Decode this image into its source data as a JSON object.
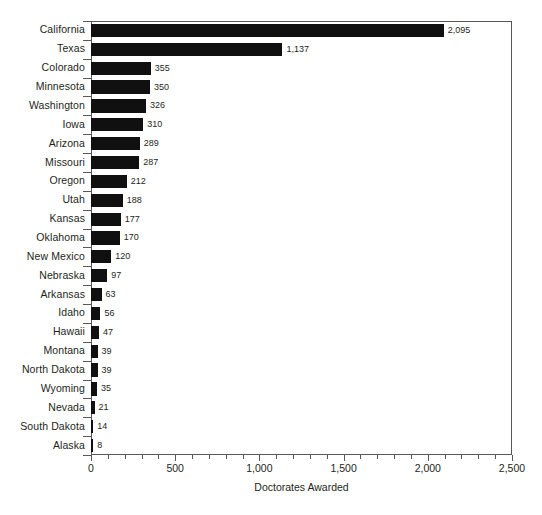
{
  "chart_data": {
    "type": "bar",
    "orientation": "horizontal",
    "title": "",
    "xlabel": "Doctorates Awarded",
    "ylabel": "",
    "xlim": [
      0,
      2500
    ],
    "xticks": [
      0,
      500,
      1000,
      1500,
      2000,
      2500
    ],
    "xtick_labels": [
      "0",
      "500",
      "1,000",
      "1,500",
      "2,000",
      "2,500"
    ],
    "minor_tick_interval": 100,
    "grid": false,
    "legend": null,
    "bar_color": "#101010",
    "axis_color": "#58585b",
    "text_color": "#231f20",
    "background": "#ffffff",
    "categories": [
      "California",
      "Texas",
      "Colorado",
      "Minnesota",
      "Washington",
      "Iowa",
      "Arizona",
      "Missouri",
      "Oregon",
      "Utah",
      "Kansas",
      "Oklahoma",
      "New Mexico",
      "Nebraska",
      "Arkansas",
      "Idaho",
      "Hawaii",
      "Montana",
      "North Dakota",
      "Wyoming",
      "Nevada",
      "South Dakota",
      "Alaska"
    ],
    "values": [
      2095,
      1137,
      355,
      350,
      326,
      310,
      289,
      287,
      212,
      188,
      177,
      170,
      120,
      97,
      63,
      56,
      47,
      39,
      39,
      35,
      21,
      14,
      8
    ],
    "value_labels": [
      "2,095",
      "1,137",
      "355",
      "350",
      "326",
      "310",
      "289",
      "287",
      "212",
      "188",
      "177",
      "170",
      "120",
      "97",
      "63",
      "56",
      "47",
      "39",
      "39",
      "35",
      "21",
      "14",
      "8"
    ]
  }
}
